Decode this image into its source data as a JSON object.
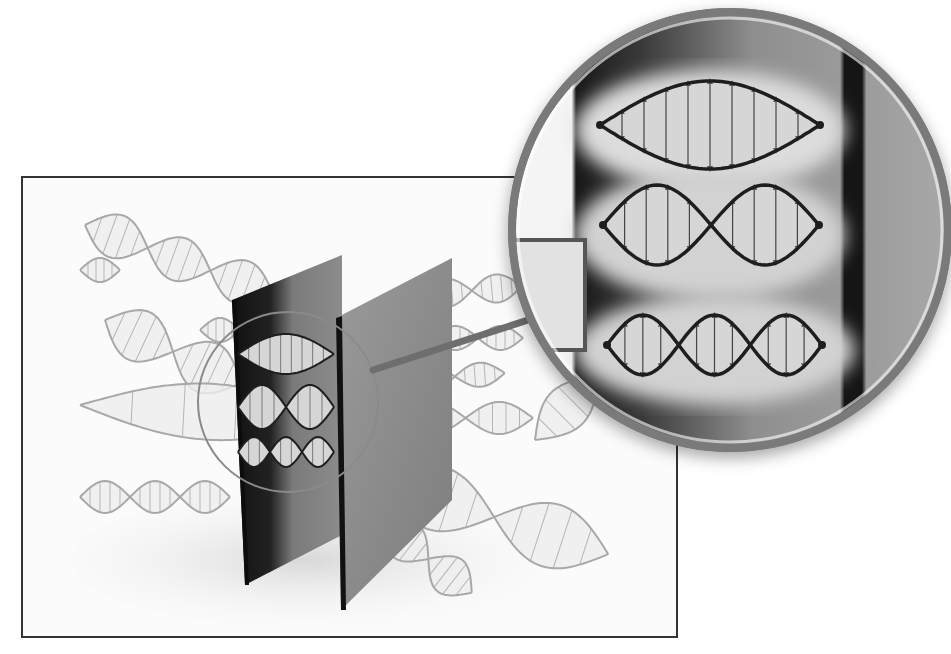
{
  "figure": {
    "colors": {
      "frame": "#333333",
      "background_panel": "#fafafa",
      "plate_dark": "#1a1a1a",
      "plate_gray": "#8a8a8a",
      "wave_outline": "#1e1e1e",
      "wave_fill": "#d6d6d6",
      "faint_wave": "#a8a8a8",
      "magnifier_ring": "#7a7a7a"
    },
    "frame": {
      "x": 22,
      "y": 177,
      "width": 655,
      "height": 460
    },
    "magnifier": {
      "cx": 730,
      "cy": 230,
      "r": 222
    },
    "small_lens": {
      "cx": 288,
      "cy": 402,
      "r": 90
    },
    "modes": [
      {
        "n": 1,
        "label": "mode-1",
        "half_wavelengths": 1
      },
      {
        "n": 2,
        "label": "mode-2",
        "half_wavelengths": 2
      },
      {
        "n": 3,
        "label": "mode-3",
        "half_wavelengths": 3
      }
    ],
    "background_waves": [
      {
        "x": 85,
        "y": 225,
        "len": 200,
        "amp": 22,
        "halves": 3,
        "angle": 20
      },
      {
        "x": 80,
        "y": 270,
        "len": 40,
        "amp": 12,
        "halves": 1,
        "angle": 0
      },
      {
        "x": 105,
        "y": 320,
        "len": 150,
        "amp": 26,
        "halves": 2,
        "angle": 25
      },
      {
        "x": 80,
        "y": 405,
        "len": 260,
        "amp": 28,
        "halves": 1,
        "angle": 3
      },
      {
        "x": 80,
        "y": 497,
        "len": 150,
        "amp": 16,
        "halves": 3,
        "angle": 0
      },
      {
        "x": 200,
        "y": 330,
        "len": 40,
        "amp": 12,
        "halves": 1,
        "angle": 0
      },
      {
        "x": 422,
        "y": 295,
        "len": 100,
        "amp": 14,
        "halves": 2,
        "angle": -5
      },
      {
        "x": 433,
        "y": 338,
        "len": 90,
        "amp": 12,
        "halves": 2,
        "angle": 0
      },
      {
        "x": 405,
        "y": 380,
        "len": 100,
        "amp": 12,
        "halves": 2,
        "angle": -4
      },
      {
        "x": 398,
        "y": 418,
        "len": 135,
        "amp": 16,
        "halves": 2,
        "angle": 0
      },
      {
        "x": 380,
        "y": 480,
        "len": 240,
        "amp": 32,
        "halves": 2,
        "angle": 18
      },
      {
        "x": 385,
        "y": 525,
        "len": 110,
        "amp": 20,
        "halves": 2,
        "angle": 38
      },
      {
        "x": 535,
        "y": 440,
        "len": 90,
        "amp": 22,
        "halves": 1,
        "angle": -45
      }
    ]
  }
}
